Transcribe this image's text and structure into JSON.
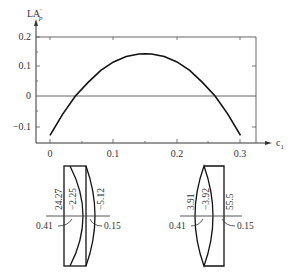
{
  "chart_data": {
    "type": "line",
    "title": "",
    "xlabel": "c1",
    "ylabel": "LA'p",
    "xlim": [
      0,
      0.33
    ],
    "ylim": [
      -0.15,
      0.22
    ],
    "grid": false,
    "xticks": [
      0,
      0.1,
      0.2,
      0.3
    ],
    "xtick_labels": [
      "0",
      "0.1",
      "0.2",
      "0.3"
    ],
    "yticks": [
      -0.1,
      0,
      0.1,
      0.2
    ],
    "ytick_labels": [
      "−0.1",
      "0",
      "0.1",
      "0.2"
    ],
    "series": [
      {
        "name": "LA'p vs c1",
        "x": [
          0,
          0.02,
          0.04,
          0.06,
          0.08,
          0.1,
          0.12,
          0.14,
          0.15,
          0.16,
          0.18,
          0.2,
          0.22,
          0.24,
          0.26,
          0.28,
          0.3
        ],
        "y": [
          -0.13,
          -0.06,
          0.0,
          0.045,
          0.085,
          0.113,
          0.131,
          0.139,
          0.14,
          0.139,
          0.131,
          0.113,
          0.085,
          0.045,
          0.0,
          -0.06,
          -0.13
        ]
      }
    ],
    "annotations": [
      "horizontal reference line at y = 0"
    ]
  },
  "lens_diagrams": [
    {
      "name": "lens-left",
      "labels": {
        "r1": "24.27",
        "r2": "−2.25",
        "r3": "−5.12",
        "d_left": "0.41",
        "d_right": "0.15"
      }
    },
    {
      "name": "lens-right",
      "labels": {
        "r1": "3.91",
        "r2": "−3.92",
        "r3": "55.5",
        "d_left": "0.41",
        "d_right": "0.15"
      }
    }
  ],
  "axis_labels": {
    "y_main": "LA",
    "y_sup": "′",
    "y_sub": "p",
    "x_main": "c",
    "x_sub": "1"
  }
}
